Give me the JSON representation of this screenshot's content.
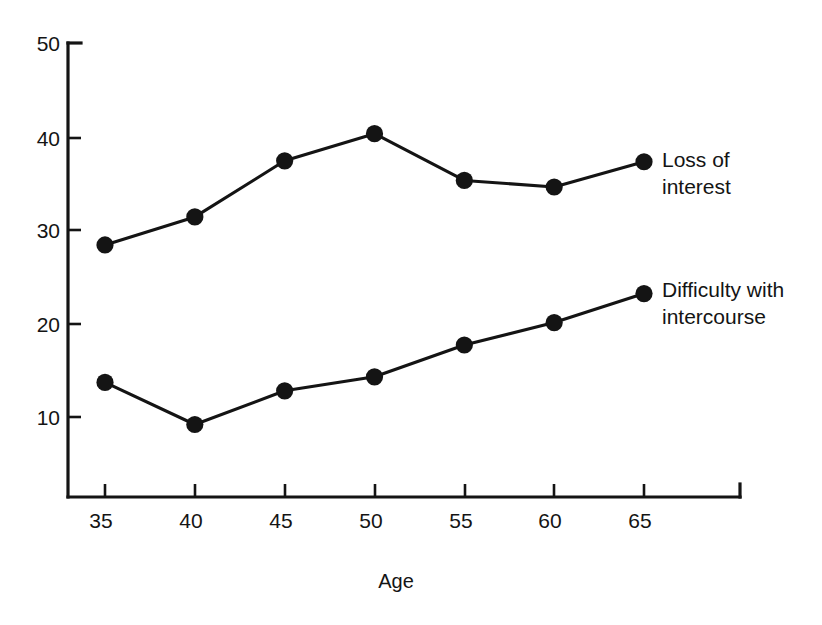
{
  "chart_data": {
    "type": "line",
    "title": "",
    "xlabel": "Age",
    "ylabel": "",
    "x": [
      35,
      40,
      45,
      50,
      55,
      60,
      65
    ],
    "categories": [
      "35",
      "40",
      "45",
      "50",
      "55",
      "60",
      "65"
    ],
    "xtick_labels": [
      "35",
      "40",
      "45",
      "50",
      "55",
      "60",
      "65"
    ],
    "ytick_labels": [
      "10",
      "20",
      "30",
      "40",
      "50"
    ],
    "yticks": [
      10,
      20,
      30,
      40,
      50
    ],
    "xlim": [
      33,
      68
    ],
    "ylim": [
      0,
      50
    ],
    "grid": false,
    "legend_position": "right-inline-labels",
    "series": [
      {
        "name": "Loss of interest",
        "label_line1": "Loss of",
        "label_line2": "interest",
        "color": "#141414",
        "values": [
          28.4,
          31.4,
          37.4,
          40.3,
          35.3,
          34.6,
          37.3
        ]
      },
      {
        "name": "Difficulty with intercourse",
        "label_line1": "Difficulty with",
        "label_line2": "intercourse",
        "color": "#141414",
        "values": [
          13.7,
          9.2,
          12.8,
          14.3,
          17.7,
          20.1,
          23.2
        ]
      }
    ]
  },
  "axes": {
    "x_axis_title": "Age",
    "y_tick_50": "50",
    "y_tick_40": "40",
    "y_tick_30": "30",
    "y_tick_20": "20",
    "y_tick_10": "10",
    "x_tick_35": "35",
    "x_tick_40": "40",
    "x_tick_45": "45",
    "x_tick_50": "50",
    "x_tick_55": "55",
    "x_tick_60": "60",
    "x_tick_65": "65"
  },
  "labels": {
    "loss_of_interest_line1": "Loss of",
    "loss_of_interest_line2": "interest",
    "difficulty_line1": "Difficulty with",
    "difficulty_line2": "intercourse"
  },
  "colors": {
    "ink": "#141414",
    "background": "#ffffff"
  }
}
